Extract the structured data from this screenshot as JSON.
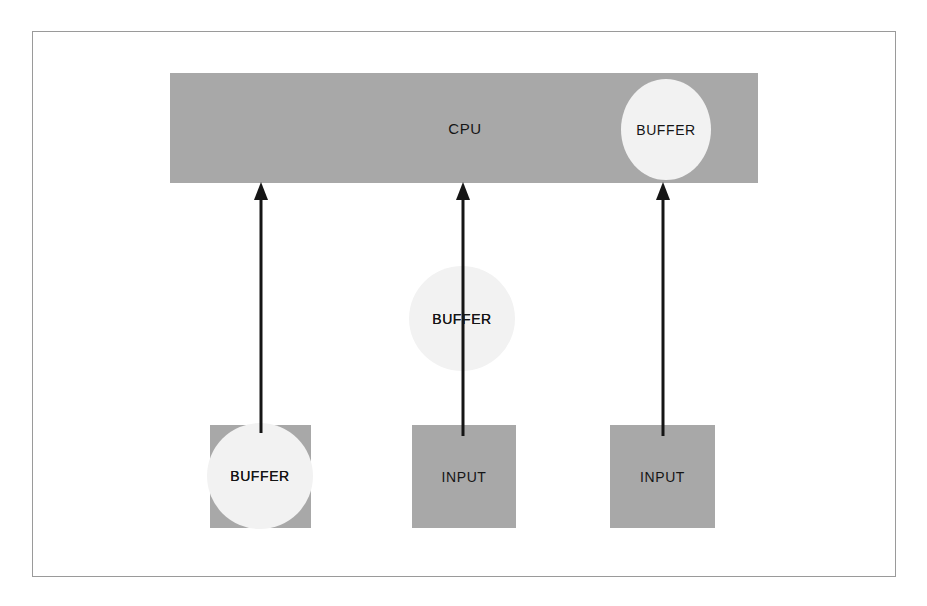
{
  "diagram": {
    "colors": {
      "bar_fill": "#a8a8a8",
      "box_fill": "#a8a8a8",
      "circle_fill": "#f2f2f2",
      "stroke": "#151515",
      "frame": "#9a9a9a",
      "background": "#ffffff"
    },
    "cpu": {
      "label": "CPU",
      "buffer_label": "BUFFER"
    },
    "middle_buffer": {
      "label": "BUFFER"
    },
    "bottom_nodes": [
      {
        "id": "left",
        "box_label": "",
        "circle_label": "BUFFER",
        "has_circle": true
      },
      {
        "id": "middle",
        "box_label": "INPUT",
        "circle_label": "",
        "has_circle": false
      },
      {
        "id": "right",
        "box_label": "INPUT",
        "circle_label": "",
        "has_circle": false
      }
    ],
    "arrows": [
      {
        "id": "left-arrow",
        "from": "left-buffer",
        "to": "cpu",
        "direction": "up"
      },
      {
        "id": "middle-arrow",
        "from": "middle-input",
        "to": "cpu",
        "direction": "up",
        "via": "middle-buffer"
      },
      {
        "id": "right-arrow",
        "from": "right-input",
        "to": "cpu",
        "direction": "up"
      }
    ]
  }
}
